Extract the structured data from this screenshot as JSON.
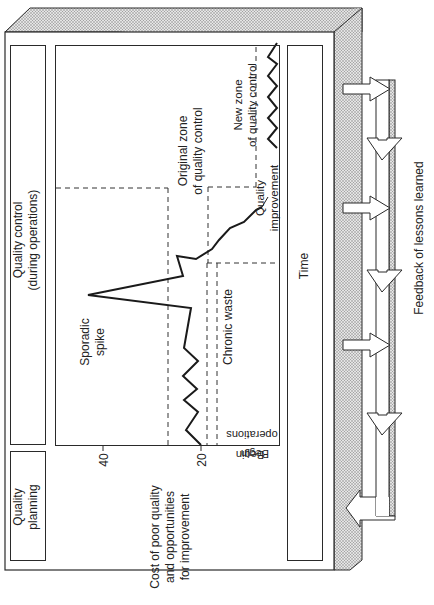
{
  "diagram": {
    "orientation": "rotated 90 degrees counter-clockwise",
    "sections": {
      "quality_planning": {
        "label_line1": "Quality",
        "label_line2": "planning"
      },
      "quality_control": {
        "label_line1": "Quality control",
        "label_line2": "(during operations)"
      },
      "time_axis": {
        "label": "Time"
      },
      "feedback": {
        "label": "Feedback of lessons learned"
      }
    },
    "y_axis": {
      "label_line1": "Cost of poor quality",
      "label_line2": "and opportunities",
      "label_line3": "for improvement",
      "ticks": [
        "40",
        "20"
      ]
    },
    "annotations": {
      "begin_operations_line1": "Begin",
      "begin_operations_line2": "operations",
      "sporadic_spike_line1": "Sporadic",
      "sporadic_spike_line2": "spike",
      "original_zone_line1": "Original zone",
      "original_zone_line2": "of quality control",
      "chronic_waste": "Chronic waste",
      "quality_improvement_line1": "Quality",
      "quality_improvement_line2": "improvement",
      "new_zone_line1": "New zone",
      "new_zone_line2": "of quality control"
    },
    "colors": {
      "line": "#1a1a1a",
      "stipple": "#9a9a9a",
      "background": "#ffffff"
    }
  }
}
